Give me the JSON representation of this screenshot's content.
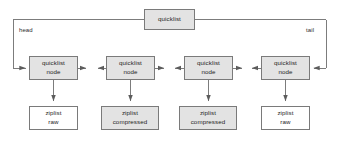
{
  "diagram": {
    "title": "quicklist",
    "type": "linked-list-structure",
    "canvas": {
      "width": 339,
      "height": 148,
      "background": "#ffffff"
    },
    "colors": {
      "box_fill_gray": "#e3e3e3",
      "box_fill_white": "#ffffff",
      "box_stroke": "#7a7a7a",
      "line_stroke": "#6e6e6e",
      "text": "#1d1d1d"
    },
    "root_box": {
      "label": "quicklist",
      "fill": "gray",
      "x": 144,
      "y": 9,
      "w": 51,
      "h": 21
    },
    "edge_labels": [
      {
        "name": "head",
        "text": "head",
        "x": 19,
        "y": 27
      },
      {
        "name": "tail",
        "text": "tail",
        "x": 306,
        "y": 27
      }
    ],
    "nodes": [
      {
        "id": "node-1",
        "lines": [
          "quicklist",
          "node"
        ],
        "fill": "gray",
        "x": 29,
        "y": 56,
        "w": 49,
        "h": 24,
        "child": {
          "id": "ziplist-1",
          "lines": [
            "ziplist",
            "raw"
          ],
          "fill": "white",
          "x": 29,
          "y": 106,
          "w": 49,
          "h": 24
        }
      },
      {
        "id": "node-2",
        "lines": [
          "quicklist",
          "node"
        ],
        "fill": "gray",
        "x": 106,
        "y": 56,
        "w": 49,
        "h": 24,
        "child": {
          "id": "ziplist-2",
          "lines": [
            "ziplist",
            "compressed"
          ],
          "fill": "gray",
          "x": 101,
          "y": 106,
          "w": 58,
          "h": 24
        }
      },
      {
        "id": "node-3",
        "lines": [
          "quicklist",
          "node"
        ],
        "fill": "gray",
        "x": 184,
        "y": 56,
        "w": 49,
        "h": 24,
        "child": {
          "id": "ziplist-3",
          "lines": [
            "ziplist",
            "compressed"
          ],
          "fill": "gray",
          "x": 179,
          "y": 106,
          "w": 58,
          "h": 24
        }
      },
      {
        "id": "node-4",
        "lines": [
          "quicklist",
          "node"
        ],
        "fill": "gray",
        "x": 261,
        "y": 56,
        "w": 49,
        "h": 24,
        "child": {
          "id": "ziplist-4",
          "lines": [
            "ziplist",
            "raw"
          ],
          "fill": "white",
          "x": 261,
          "y": 106,
          "w": 49,
          "h": 24
        }
      }
    ],
    "connections": {
      "head_path": "from quicklist left edge, left to x=13, down to y=68, right arrow into node-1",
      "tail_path": "from quicklist right edge, right to x=326, down to y=68, left arrow into node-4",
      "sibling_links": "bidirectional arrows between adjacent quicklist nodes",
      "child_links": "downward arrows from each quicklist node to its ziplist"
    },
    "caption": ""
  }
}
